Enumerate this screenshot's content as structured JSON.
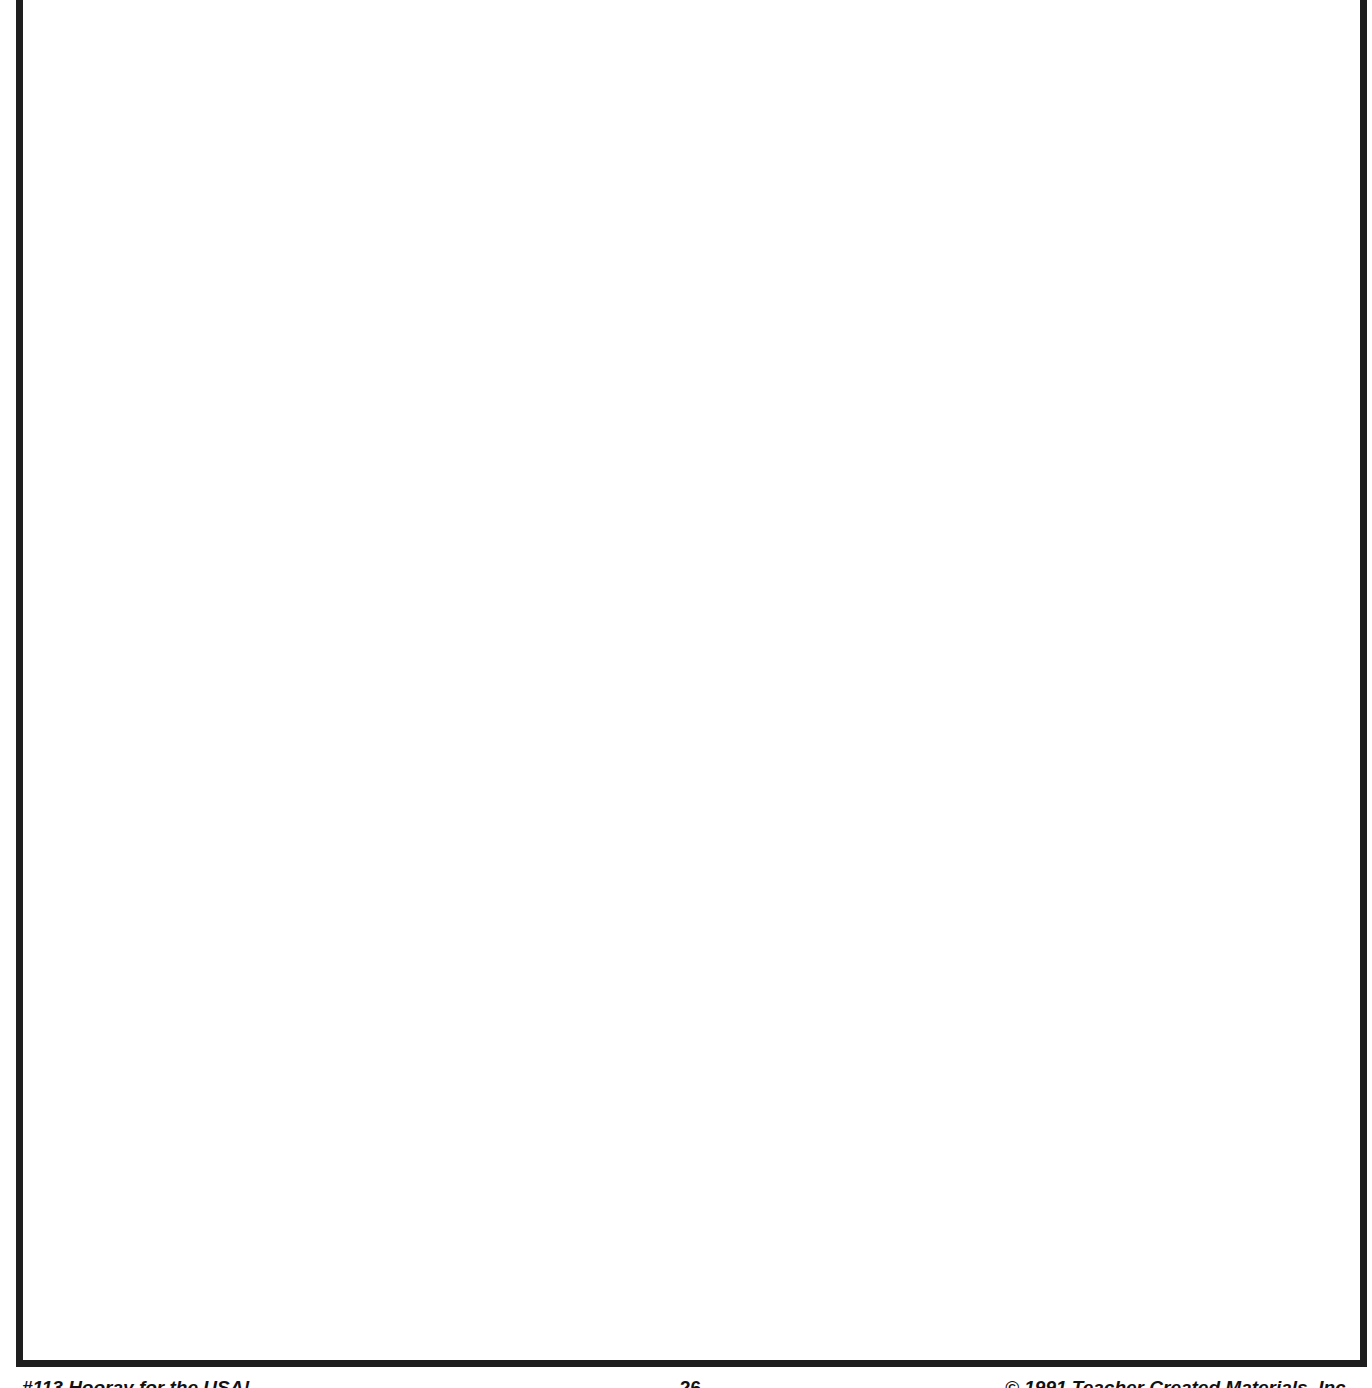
{
  "page": {
    "frame": {
      "border_color": "#1e1e1e",
      "content": ""
    },
    "footer": {
      "left_text": "#113 Hooray for the USA!",
      "page_number": "26",
      "right_text": "© 1991 Teacher Created Materials, Inc"
    }
  }
}
